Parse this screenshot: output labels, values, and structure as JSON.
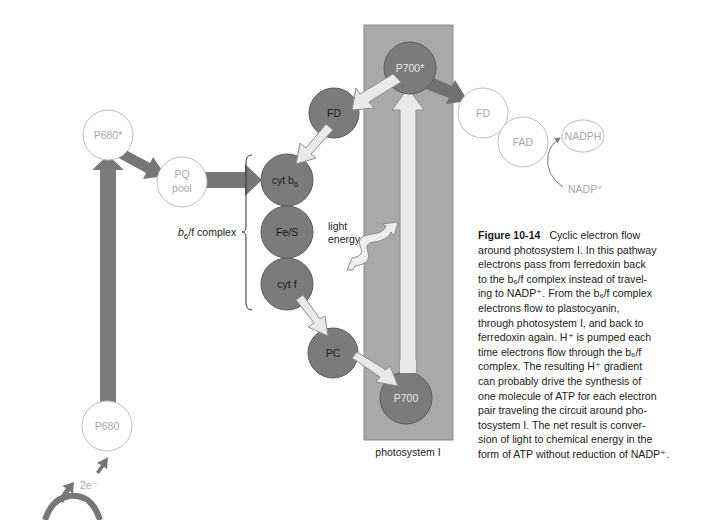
{
  "figure": {
    "number": "Figure 10-14",
    "caption_lines": [
      "Cyclic electron flow",
      "around photosystem I. In this pathway",
      "electrons pass from ferredoxin back",
      "to the b₆/f complex instead of travel-",
      "ing to NADP⁺. From the b₆/f complex",
      "electrons flow to plastocyanin,",
      "through photosystem I, and back to",
      "ferredoxin again. H⁺ is pumped each",
      "time electrons flow through the b₆/f",
      "complex. The resulting H⁺ gradient",
      "can probably drive the synthesis of",
      "one molecule of ATP for each electron",
      "pair traveling the circuit around pho-",
      "tosystem I. The net result is conver-",
      "sion of light to chemical energy in the",
      "form of ATP without reduction of NADP⁺."
    ]
  },
  "nodes": {
    "p680_star": "P680*",
    "pq_pool_line1": "PQ",
    "pq_pool_line2": "pool",
    "p680": "P680",
    "fd_cyclic": "FD",
    "cyt_b6": "cyt b",
    "cyt_b6_sub": "6",
    "fe_s": "Fe/S",
    "cyt_f": "cyt f",
    "pc": "PC",
    "p700_star": "P700*",
    "p700": "P700",
    "fd_noncyclic": "FD",
    "fad": "FAD",
    "nadph": "NADPH",
    "nadp_plus": "NADP⁺"
  },
  "labels": {
    "b6f_complex": "b",
    "b6f_complex_sub": "6",
    "b6f_complex_rest": "/f complex",
    "light_line1": "light",
    "light_line2": "energy",
    "photosystem": "photosystem I",
    "two_electrons": "2e⁻"
  },
  "colors": {
    "photosystem_box": "#a9a9a9",
    "active_node": "#7b7b7b",
    "inactive_node_stroke": "#bdbdbd",
    "inactive_text": "#a8a8a8",
    "dark_arrow": "#777777",
    "light_arrow": "#e8e8e8"
  }
}
